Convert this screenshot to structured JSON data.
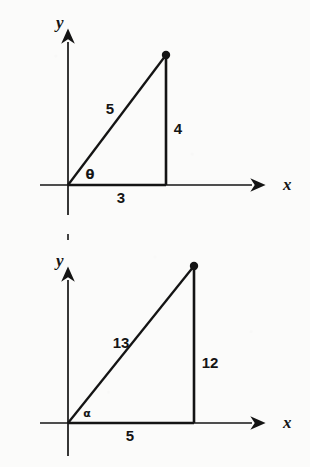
{
  "page": {
    "background_color": "#fbfbfa",
    "ink_color": "#141414",
    "width": 310,
    "height": 467
  },
  "figures": [
    {
      "id": "figure-theta",
      "name": "right-triangle-3-4-5",
      "axes": {
        "x_label": "x",
        "y_label": "y",
        "x_axis": {
          "x1": 40,
          "y1": 185,
          "x2": 262,
          "y2": 185
        },
        "y_axis": {
          "x1": 68,
          "y1": 215,
          "x2": 68,
          "y2": 32
        },
        "x_label_pos": {
          "x": 283,
          "y": 188
        },
        "y_label_pos": {
          "x": 56,
          "y": 28
        }
      },
      "triangle": {
        "origin": {
          "x": 68,
          "y": 185
        },
        "apex": {
          "x": 166,
          "y": 55
        },
        "foot": {
          "x": 166,
          "y": 185
        },
        "vertex_dot": {
          "x": 166,
          "y": 55,
          "r": 4
        }
      },
      "labels": {
        "hypotenuse": "5",
        "vertical": "4",
        "base": "3",
        "angle": "θ"
      },
      "label_positions": {
        "hypotenuse": {
          "x": 110,
          "y": 114
        },
        "vertical": {
          "x": 178,
          "y": 134
        },
        "base": {
          "x": 121,
          "y": 203
        },
        "angle": {
          "x": 89,
          "y": 179
        }
      }
    },
    {
      "id": "figure-alpha",
      "name": "right-triangle-5-12-13",
      "axes": {
        "x_label": "x",
        "y_label": "y",
        "x_axis": {
          "x1": 40,
          "y1": 189,
          "x2": 262,
          "y2": 189
        },
        "y_axis": {
          "x1": 68,
          "y1": 222,
          "x2": 68,
          "y2": 36
        },
        "x_label_pos": {
          "x": 283,
          "y": 192
        },
        "y_label_pos": {
          "x": 56,
          "y": 32
        }
      },
      "triangle": {
        "origin": {
          "x": 68,
          "y": 189
        },
        "apex": {
          "x": 194,
          "y": 32
        },
        "foot": {
          "x": 194,
          "y": 189
        },
        "vertex_dot": {
          "x": 194,
          "y": 32,
          "r": 4
        }
      },
      "labels": {
        "hypotenuse": "13",
        "vertical": "12",
        "base": "5",
        "angle": "α"
      },
      "label_positions": {
        "hypotenuse": {
          "x": 121,
          "y": 114
        },
        "vertical": {
          "x": 208,
          "y": 134
        },
        "base": {
          "x": 130,
          "y": 207
        },
        "angle": {
          "x": 86,
          "y": 183
        }
      }
    }
  ]
}
